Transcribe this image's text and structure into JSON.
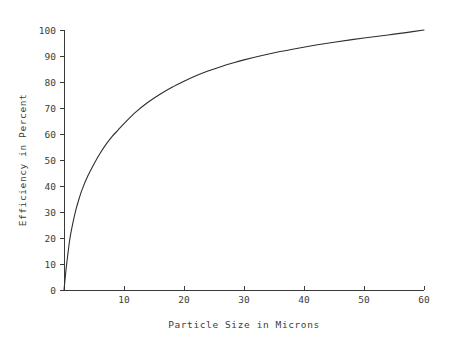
{
  "chart_data": {
    "type": "line",
    "title": "",
    "xlabel": "Particle Size in Microns",
    "ylabel": "Efficiency in Percent",
    "xlim": [
      0,
      60
    ],
    "ylim": [
      0,
      100
    ],
    "xticks": [
      10,
      20,
      30,
      40,
      50,
      60
    ],
    "xtick_labels": [
      "10",
      "20",
      "30",
      "40",
      "50",
      "60"
    ],
    "yticks": [
      0,
      10,
      20,
      30,
      40,
      50,
      60,
      70,
      80,
      90,
      100
    ],
    "ytick_labels": [
      "0",
      "10",
      "20",
      "30",
      "40",
      "50",
      "60",
      "70",
      "80",
      "90",
      "100"
    ],
    "grid": false,
    "legend": false,
    "legend_position": "none",
    "series": [
      {
        "name": "Collection Efficiency",
        "color": "#2e2e2e",
        "x": [
          0,
          0.3,
          0.6,
          1,
          1.5,
          2,
          2.5,
          3,
          4,
          5,
          6,
          7,
          8,
          9,
          10,
          12,
          14,
          16,
          18,
          20,
          22,
          24,
          26,
          28,
          30,
          33,
          36,
          39,
          42,
          45,
          48,
          51,
          54,
          57,
          60
        ],
        "y": [
          0,
          7,
          13,
          20,
          26,
          31,
          35,
          38.5,
          44,
          48.5,
          52.5,
          56,
          59,
          61.5,
          64,
          68.5,
          72.2,
          75.3,
          78,
          80.3,
          82.4,
          84.2,
          85.8,
          87.2,
          88.5,
          90.2,
          91.7,
          93,
          94.2,
          95.3,
          96.3,
          97.2,
          98.1,
          99,
          100
        ]
      }
    ],
    "axis_color": "#3a3a3a",
    "background_color": "#ffffff"
  },
  "plot_geometry": {
    "origin_x": 64,
    "origin_y": 290,
    "axis_right_x": 424,
    "axis_top_y": 30,
    "px_per_micron": 6,
    "px_per_percent": 2.6
  }
}
